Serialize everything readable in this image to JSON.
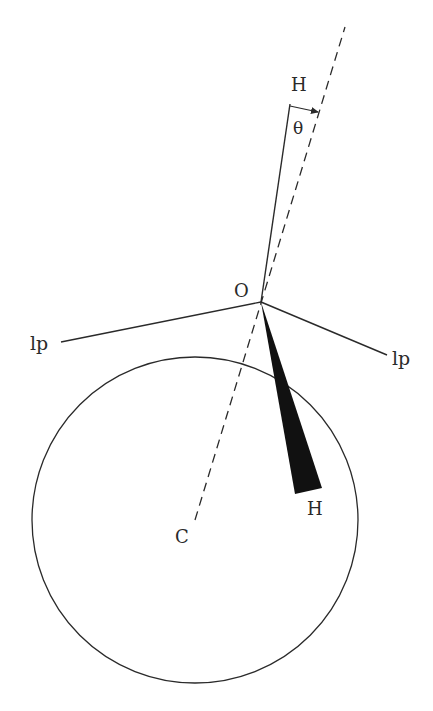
{
  "diagram": {
    "labels": {
      "top_h": "H",
      "theta": "θ",
      "oxygen": "O",
      "lp_left": "lp",
      "lp_right": "lp",
      "bottom_h": "H",
      "center": "C"
    },
    "geometry": {
      "circle": {
        "cx": 195,
        "cy": 520,
        "r": 163
      },
      "oxygen_point": [
        261,
        302
      ],
      "dashed_axis": {
        "from": [
          195,
          520
        ],
        "to": [
          345,
          27
        ]
      },
      "oh_bond_top": {
        "from": [
          261,
          302
        ],
        "to": [
          290,
          104
        ]
      },
      "lp_left_line": {
        "from": [
          261,
          302
        ],
        "to": [
          61,
          342
        ]
      },
      "lp_right_line": {
        "from": [
          261,
          302
        ],
        "to": [
          387,
          355
        ]
      },
      "wedge": [
        [
          261,
          302
        ],
        [
          295,
          494
        ],
        [
          322,
          488
        ]
      ],
      "theta_arrow": {
        "from": [
          290,
          106
        ],
        "to": [
          318,
          112
        ]
      }
    },
    "colors": {
      "line": "#2a2a2a",
      "wedge": "#111111",
      "background": "#ffffff"
    }
  }
}
